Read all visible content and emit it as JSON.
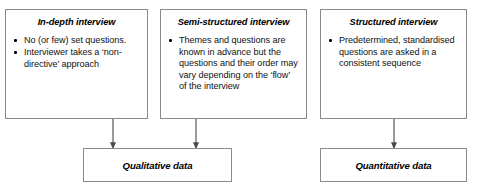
{
  "diagram": {
    "interview_types": [
      {
        "id": "in-depth",
        "title": "In-depth interview",
        "points": [
          "No (or few) set questions.",
          "Interviewer takes a ‘non-directive’ approach"
        ]
      },
      {
        "id": "semi-structured",
        "title": "Semi-structured interview",
        "points": [
          "Themes and questions are known in advance but the questions and their order may vary depending on the ‘flow’ of the interview"
        ]
      },
      {
        "id": "structured",
        "title": "Structured interview",
        "points": [
          "Predetermined, standardised questions are asked in a consistent sequence"
        ]
      }
    ],
    "outcomes": [
      {
        "id": "qualitative",
        "label": "Qualitative data"
      },
      {
        "id": "quantitative",
        "label": "Quantitative data"
      }
    ],
    "connectors": [
      {
        "id": "in-depth-to-qualitative",
        "from": "in-depth",
        "to": "qualitative"
      },
      {
        "id": "semi-structured-to-qualitative",
        "from": "semi-structured",
        "to": "qualitative"
      },
      {
        "id": "structured-to-quantitative",
        "from": "structured",
        "to": "quantitative"
      }
    ],
    "colors": {
      "border": "#8a8a8a",
      "connector": "#6f6f6f",
      "text": "#111111",
      "background": "#ffffff"
    }
  }
}
